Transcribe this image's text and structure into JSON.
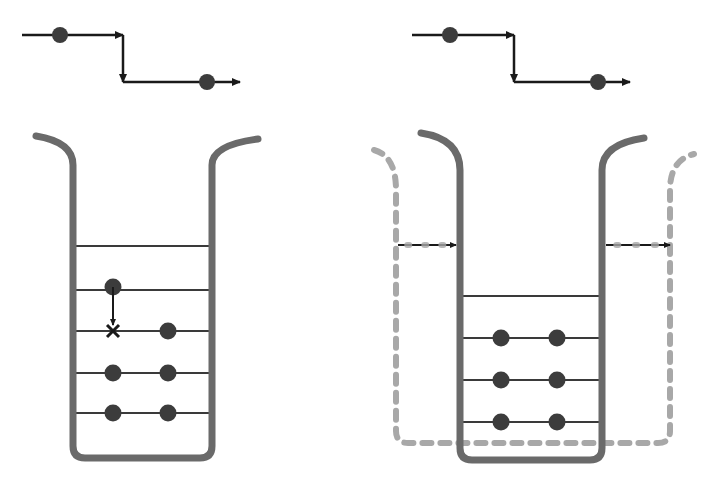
{
  "colors": {
    "background": "#ffffff",
    "wall": "#6a6a6a",
    "dashed_wall": "#a8a8a8",
    "level_line": "#3a3a3a",
    "dot": "#3c3c3c",
    "arrow": "#1a1a1a"
  },
  "panels": [
    {
      "id": "left",
      "step_arrow": {
        "path": [
          [
            22,
            35
          ],
          [
            123,
            35
          ],
          [
            123,
            82
          ],
          [
            240,
            82
          ]
        ],
        "dots": [
          [
            60,
            35
          ],
          [
            207,
            82
          ]
        ]
      },
      "well": {
        "left_x": 73,
        "right_x": 212,
        "top_y": 165,
        "bottom_y": 458,
        "left_lip": [
          36,
          136
        ],
        "right_lip": [
          258,
          139
        ]
      },
      "levels_y": [
        246,
        290,
        331,
        373,
        413
      ],
      "dots": [
        [
          113,
          287
        ],
        [
          168,
          331
        ],
        [
          113,
          373
        ],
        [
          168,
          373
        ],
        [
          113,
          413
        ],
        [
          168,
          413
        ]
      ],
      "transition": {
        "from": [
          113,
          287
        ],
        "to": [
          113,
          325
        ],
        "blocked_mark": [
          113,
          331
        ],
        "mark_label": "×"
      }
    },
    {
      "id": "right",
      "step_arrow": {
        "path": [
          [
            412,
            35
          ],
          [
            514,
            35
          ],
          [
            514,
            82
          ],
          [
            630,
            82
          ]
        ],
        "dots": [
          [
            450,
            35
          ],
          [
            598,
            82
          ]
        ]
      },
      "well": {
        "left_x": 460,
        "right_x": 602,
        "top_y": 170,
        "bottom_y": 460,
        "left_lip": [
          421,
          133
        ],
        "right_lip": [
          644,
          138
        ]
      },
      "dashed_well": {
        "left_x": 396,
        "right_x": 670,
        "top_y": 190,
        "bottom_y": 443,
        "left_lip": [
          374,
          150
        ],
        "right_lip": [
          694,
          154
        ]
      },
      "widening_arrows": [
        {
          "from": [
            398,
            245
          ],
          "to": [
            456,
            245
          ]
        },
        {
          "from": [
            606,
            245
          ],
          "to": [
            670,
            245
          ]
        }
      ],
      "levels_y": [
        296,
        338,
        380,
        422
      ],
      "dots": [
        [
          501,
          338
        ],
        [
          557,
          338
        ],
        [
          501,
          380
        ],
        [
          557,
          380
        ],
        [
          501,
          422
        ],
        [
          557,
          422
        ]
      ]
    }
  ]
}
